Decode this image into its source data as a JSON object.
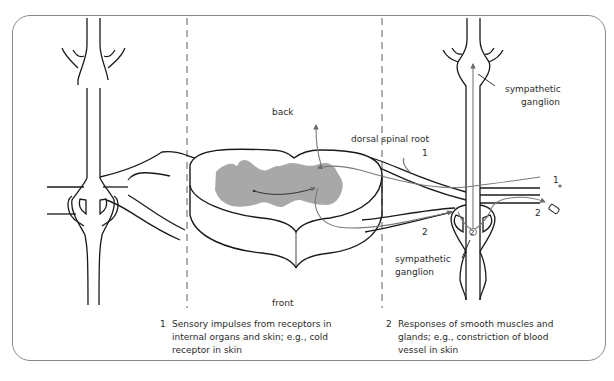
{
  "diagram": {
    "type": "anatomical cross-section",
    "labels": {
      "back": "back",
      "front": "front",
      "dorsal_root": "dorsal spinal root",
      "ganglion_top": "sympathetic\nganglion",
      "ganglion_top_line1": "sympathetic",
      "ganglion_top_line2": "ganglion",
      "ganglion_bottom_line1": "sympathetic",
      "ganglion_bottom_line2": "ganglion"
    },
    "path_markers": {
      "m1_top": "1",
      "m1_right": "1",
      "m2_bottom": "2",
      "m2_right": "2",
      "m2_ganglion": "2"
    },
    "captions": [
      {
        "number": "1",
        "text": "Sensory impulses from receptors in internal organs and skin; e.g., cold receptor in skin"
      },
      {
        "number": "2",
        "text": "Responses of smooth muscles and glands; e.g., constriction of blood vessel in skin"
      }
    ],
    "colors": {
      "outline": "#1a1a1a",
      "gray_matter": "#a8a8a8",
      "pathway": "#7a7a7a",
      "frame": "#8a8a8a"
    }
  }
}
